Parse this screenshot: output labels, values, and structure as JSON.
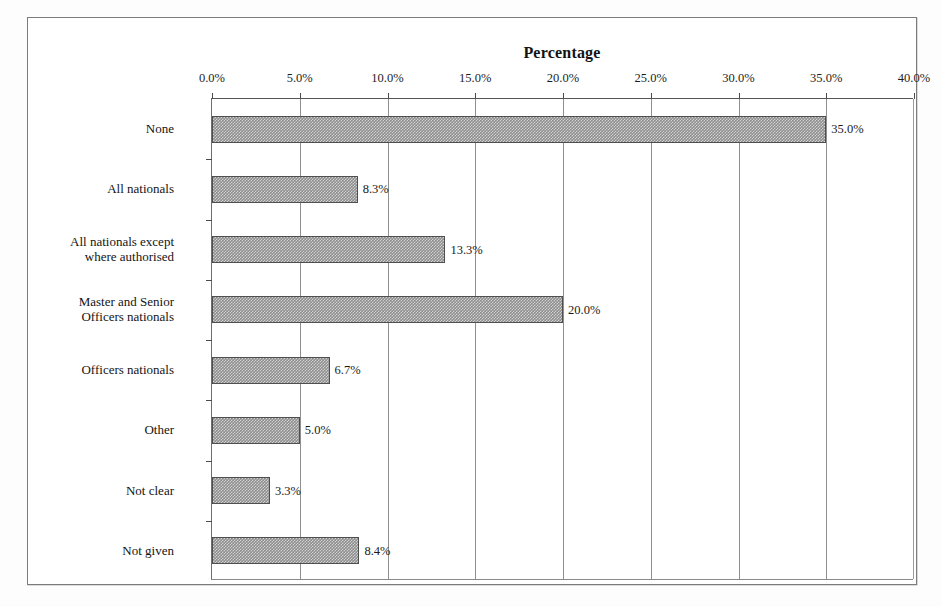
{
  "chart_data": {
    "type": "bar",
    "orientation": "horizontal",
    "title": "Percentage",
    "xlabel": "",
    "ylabel": "",
    "xlim": [
      0,
      40
    ],
    "xticks": [
      "0.0%",
      "5.0%",
      "10.0%",
      "15.0%",
      "20.0%",
      "25.0%",
      "30.0%",
      "35.0%",
      "40.0%"
    ],
    "xtick_values": [
      0,
      5,
      10,
      15,
      20,
      25,
      30,
      35,
      40
    ],
    "grid": "vertical",
    "legend": "none",
    "axis_position": "top",
    "categories": [
      "None",
      "All nationals",
      "All nationals except\nwhere authorised",
      "Master and Senior\nOfficers nationals",
      "Officers nationals",
      "Other",
      "Not clear",
      "Not given"
    ],
    "values": [
      35.0,
      8.3,
      13.3,
      20.0,
      6.7,
      5.0,
      3.3,
      8.4
    ],
    "data_labels": [
      "35.0%",
      "8.3%",
      "13.3%",
      "20.0%",
      "6.7%",
      "5.0%",
      "3.3%",
      "8.4%"
    ],
    "bar_fill_color": "#8d8d8d",
    "bar_border_color": "#4f4f4f",
    "gridline_color": "#8f8f8f",
    "background_color": "#ffffff"
  }
}
